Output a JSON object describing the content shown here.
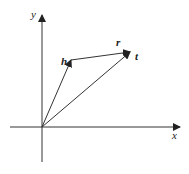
{
  "diagram": {
    "type": "vector-diagram",
    "colors": {
      "stroke": "#333333",
      "text": "#222222",
      "background": "#ffffff"
    },
    "axes": {
      "x_label": "x",
      "y_label": "y",
      "origin": [
        42,
        127
      ]
    },
    "vectors": [
      {
        "id": "h",
        "label": "h",
        "from": "origin",
        "to": [
          71,
          60
        ]
      },
      {
        "id": "t",
        "label": "t",
        "from": "origin",
        "to": [
          130,
          52
        ]
      },
      {
        "id": "r",
        "label": "r",
        "from": [
          71,
          60
        ],
        "to": [
          130,
          52
        ]
      }
    ]
  }
}
